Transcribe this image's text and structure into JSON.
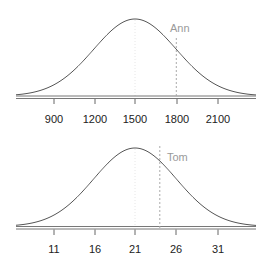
{
  "chart_data": [
    {
      "type": "line",
      "title": "",
      "description": "Normal distribution curve with a marked observation",
      "distribution": {
        "mean": 1500,
        "sd": 300
      },
      "xlabel": "",
      "ylabel": "",
      "xlim": [
        630,
        2370
      ],
      "x_ticks": [
        900,
        1200,
        1500,
        1800,
        2100
      ],
      "tick_labels": [
        "900",
        "1200",
        "1500",
        "1800",
        "2100"
      ],
      "grid": false,
      "mean_line": 1500,
      "marker": {
        "label": "Ann",
        "x": 1800,
        "style": "dashed"
      }
    },
    {
      "type": "line",
      "title": "",
      "description": "Normal distribution curve with a marked observation",
      "distribution": {
        "mean": 21,
        "sd": 5
      },
      "xlabel": "",
      "ylabel": "",
      "xlim": [
        6.5,
        35.5
      ],
      "x_ticks": [
        11,
        16,
        21,
        26,
        31
      ],
      "tick_labels": [
        "11",
        "16",
        "21",
        "26",
        "31"
      ],
      "grid": false,
      "mean_line": 21,
      "marker": {
        "label": "Tom",
        "x": 24,
        "style": "dashed"
      }
    }
  ],
  "panels": [
    {
      "marker_label": "Ann",
      "tick_labels": [
        "900",
        "1200",
        "1500",
        "1800",
        "2100"
      ]
    },
    {
      "marker_label": "Tom",
      "tick_labels": [
        "11",
        "16",
        "21",
        "26",
        "31"
      ]
    }
  ],
  "colors": {
    "curve": "#555555",
    "axis": "#666666",
    "marker_line": "#aaaaaa",
    "marker_text": "#9a9a9a",
    "tick_text": "#222222"
  }
}
